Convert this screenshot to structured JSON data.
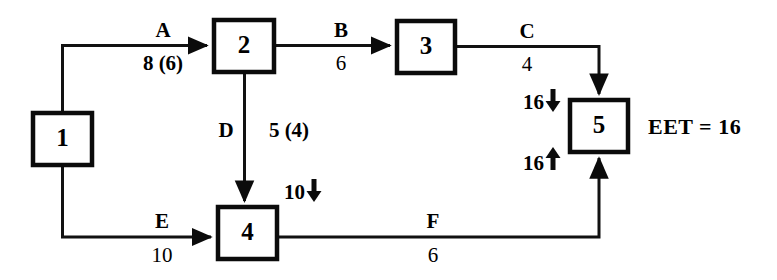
{
  "diagram": {
    "type": "activity-on-arrow-network",
    "nodes": [
      {
        "id": "node-1",
        "label": "1",
        "x": 33,
        "y": 113,
        "w": 59,
        "h": 52
      },
      {
        "id": "node-2",
        "label": "2",
        "x": 214,
        "y": 20,
        "w": 60,
        "h": 52
      },
      {
        "id": "node-3",
        "label": "3",
        "x": 397,
        "y": 21,
        "w": 58,
        "h": 52
      },
      {
        "id": "node-4",
        "label": "4",
        "x": 218,
        "y": 207,
        "w": 59,
        "h": 52
      },
      {
        "id": "node-5",
        "label": "5",
        "x": 570,
        "y": 100,
        "w": 58,
        "h": 52
      }
    ],
    "activities": [
      {
        "id": "activity-a",
        "name": "A",
        "duration": "8 (6)",
        "from": "1",
        "to": "2",
        "bold_duration": true
      },
      {
        "id": "activity-b",
        "name": "B",
        "duration": "6",
        "from": "2",
        "to": "3",
        "bold_duration": false
      },
      {
        "id": "activity-c",
        "name": "C",
        "duration": "4",
        "from": "3",
        "to": "5",
        "bold_duration": false
      },
      {
        "id": "activity-d",
        "name": "D",
        "duration": "5 (4)",
        "from": "2",
        "to": "4",
        "bold_duration": true
      },
      {
        "id": "activity-e",
        "name": "E",
        "duration": "10",
        "from": "1",
        "to": "4",
        "bold_duration": false
      },
      {
        "id": "activity-f",
        "name": "F",
        "duration": "6",
        "from": "4",
        "to": "5",
        "bold_duration": false
      }
    ],
    "event_times": [
      {
        "id": "eet-node-4",
        "value": "10",
        "arrow": "down",
        "target": "4"
      },
      {
        "id": "eet-node-5-from-c",
        "value": "16",
        "arrow": "down",
        "target": "5"
      },
      {
        "id": "eet-node-5-from-f",
        "value": "16",
        "arrow": "up",
        "target": "5"
      }
    ],
    "annotations": [
      {
        "id": "eet-result",
        "text": "EET = 16"
      }
    ],
    "colors": {
      "stroke": "#0b0b0b",
      "line": "#111111",
      "background": "#ffffff",
      "text": "#000000"
    }
  }
}
